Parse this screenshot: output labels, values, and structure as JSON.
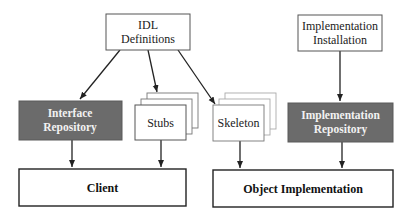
{
  "diagram": {
    "nodes": {
      "idl_definitions": {
        "line1": "IDL",
        "line2": "Definitions"
      },
      "implementation_installation": {
        "line1": "Implementation",
        "line2": "Installation"
      },
      "interface_repository": {
        "line1": "Interface",
        "line2": "Repository"
      },
      "stubs": {
        "label": "Stubs"
      },
      "skeleton": {
        "label": "Skeleton"
      },
      "implementation_repository": {
        "line1": "Implementation",
        "line2": "Repository"
      },
      "client": {
        "label": "Client"
      },
      "object_implementation": {
        "label": "Object Implementation"
      }
    },
    "edges": [
      {
        "from": "IDL Definitions",
        "to": "Interface Repository"
      },
      {
        "from": "IDL Definitions",
        "to": "Stubs"
      },
      {
        "from": "IDL Definitions",
        "to": "Skeleton"
      },
      {
        "from": "Implementation Installation",
        "to": "Implementation Repository"
      },
      {
        "from": "Interface Repository",
        "to": "Client"
      },
      {
        "from": "Stubs",
        "to": "Client"
      },
      {
        "from": "Skeleton",
        "to": "Object Implementation"
      },
      {
        "from": "Implementation Repository",
        "to": "Object Implementation"
      }
    ],
    "colors": {
      "repository_fill": "#6b6b6b",
      "repository_text": "#f2f2f2",
      "line": "#222222"
    }
  }
}
